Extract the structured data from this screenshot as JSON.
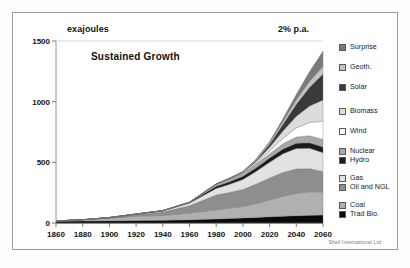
{
  "figure": {
    "unit_label": "exajoules",
    "rate_label": "2% p.a.",
    "scenario_title": "Sustained Growth",
    "credit": "Shell International Ltd"
  },
  "chart_data": {
    "type": "area",
    "title": "Sustained Growth",
    "subtitle": "2% p.a.",
    "xlabel": "",
    "ylabel": "exajoules",
    "xlim": [
      1860,
      2060
    ],
    "ylim": [
      0,
      1500
    ],
    "xticks": [
      1860,
      1880,
      1900,
      1920,
      1940,
      1960,
      1980,
      2000,
      2020,
      2040,
      2060
    ],
    "yticks": [
      0,
      500,
      1000,
      1500
    ],
    "grid": false,
    "stacked": true,
    "legend_position": "right",
    "legend_order_top_to_bottom": [
      "Surprise",
      "Geoth.",
      "Solar",
      "Biomass",
      "Wind",
      "Nuclear",
      "Hydro",
      "Gas",
      "Oil and NGL",
      "Coal",
      "Trad Bio."
    ],
    "x": [
      1860,
      1880,
      1900,
      1920,
      1940,
      1960,
      1980,
      1990,
      2000,
      2010,
      2020,
      2030,
      2040,
      2050,
      2060
    ],
    "series": [
      {
        "name": "Trad Bio.",
        "color": "#0a0a0a",
        "values": [
          14,
          16,
          18,
          20,
          22,
          26,
          33,
          37,
          41,
          46,
          51,
          56,
          60,
          63,
          65
        ]
      },
      {
        "name": "Coal",
        "color": "#b0b0b0",
        "values": [
          3,
          10,
          22,
          36,
          40,
          56,
          76,
          86,
          96,
          115,
          140,
          165,
          185,
          195,
          190
        ]
      },
      {
        "name": "Oil and NGL",
        "color": "#8e8e8e",
        "values": [
          0,
          1,
          4,
          14,
          28,
          60,
          122,
          128,
          140,
          160,
          180,
          195,
          200,
          190,
          170
        ]
      },
      {
        "name": "Gas",
        "color": "#e2e2e2",
        "values": [
          0,
          0,
          1,
          3,
          9,
          22,
          54,
          68,
          82,
          105,
          130,
          155,
          170,
          168,
          155
        ]
      },
      {
        "name": "Hydro",
        "color": "#1c1c1c",
        "values": [
          0,
          0,
          0,
          1,
          3,
          6,
          18,
          22,
          26,
          30,
          34,
          38,
          42,
          45,
          47
        ]
      },
      {
        "name": "Nuclear",
        "color": "#a8a8a8",
        "values": [
          0,
          0,
          0,
          0,
          0,
          1,
          17,
          23,
          26,
          30,
          36,
          44,
          52,
          58,
          62
        ]
      },
      {
        "name": "Wind",
        "color": "#ffffff",
        "values": [
          0,
          0,
          0,
          0,
          0,
          0,
          0,
          1,
          3,
          9,
          22,
          45,
          75,
          110,
          150
        ]
      },
      {
        "name": "Biomass",
        "color": "#dcdcdc",
        "values": [
          0,
          0,
          0,
          0,
          0,
          0,
          1,
          2,
          5,
          14,
          32,
          60,
          95,
          135,
          175
        ]
      },
      {
        "name": "Solar",
        "color": "#3a3a3a",
        "values": [
          0,
          0,
          0,
          0,
          0,
          0,
          0,
          1,
          2,
          8,
          24,
          55,
          100,
          155,
          215
        ]
      },
      {
        "name": "Geoth.",
        "color": "#c4c4c4",
        "values": [
          0,
          0,
          0,
          0,
          0,
          0,
          1,
          2,
          4,
          8,
          14,
          24,
          36,
          50,
          62
        ]
      },
      {
        "name": "Surprise",
        "color": "#7a7a7a",
        "values": [
          0,
          0,
          0,
          0,
          0,
          0,
          0,
          0,
          0,
          2,
          8,
          22,
          45,
          80,
          125
        ]
      }
    ],
    "legend": [
      {
        "label": "Surprise",
        "color": "#7a7a7a"
      },
      {
        "label": "Geoth.",
        "color": "#c4c4c4"
      },
      {
        "label": "Solar",
        "color": "#3a3a3a"
      },
      {
        "label": "Biomass",
        "color": "#dcdcdc"
      },
      {
        "label": "Wind",
        "color": "#ffffff"
      },
      {
        "label": "Nuclear",
        "color": "#a8a8a8"
      },
      {
        "label": "Hydro",
        "color": "#1c1c1c"
      },
      {
        "label": "Gas",
        "color": "#e2e2e2"
      },
      {
        "label": "Oil and NGL",
        "color": "#8e8e8e"
      },
      {
        "label": "Coal",
        "color": "#b0b0b0"
      },
      {
        "label": "Trad Bio.",
        "color": "#0a0a0a"
      }
    ]
  }
}
